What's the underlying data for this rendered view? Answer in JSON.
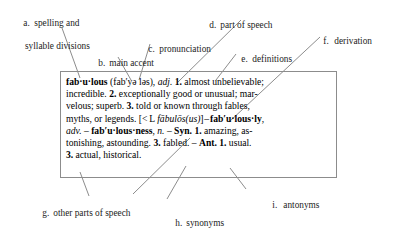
{
  "figure": {
    "kind": "annotated-dictionary-entry",
    "callouts": [
      {
        "id": "a",
        "letter": "a.",
        "label": "spelling and",
        "label2": "syllable divisions",
        "target": "fab·u·lous headword"
      },
      {
        "id": "b",
        "letter": "b.",
        "label": "main accent",
        "label2": "",
        "target": "accent mark in (fab′yə ləs)"
      },
      {
        "id": "c",
        "letter": "c.",
        "label": "pronunciation",
        "label2": "",
        "target": "(fab′yə ləs)"
      },
      {
        "id": "d",
        "letter": "d.",
        "label": "part of speech",
        "label2": "",
        "target": "adj."
      },
      {
        "id": "e",
        "letter": "e.",
        "label": "definitions",
        "label2": "",
        "target": "1. almost unbelievable; incredible."
      },
      {
        "id": "f",
        "letter": "f.",
        "label": "derivation",
        "label2": "",
        "target": "[< L fābulōs(us)]"
      },
      {
        "id": "g",
        "letter": "g.",
        "label": "other parts of speech",
        "label2": "",
        "target": "fab′u·lous·ly, adv."
      },
      {
        "id": "h",
        "letter": "h.",
        "label": "synonyms",
        "label2": "",
        "target": "Syn. 1. amazing, astonishing, astounding. 3. fabled."
      },
      {
        "id": "i",
        "letter": "i.",
        "label": "antonyms",
        "label2": "",
        "target": "Ant. 1. usual. 3. actual, historical."
      }
    ],
    "entry": {
      "headword": "fab·u·lous",
      "pronunciation": "(fab′yə ləs)",
      "part_of_speech": "adj.",
      "etymology": "[< L fābulōs(us)]",
      "definitions": [
        {
          "number": "1.",
          "text": "almost unbelievable; incredible."
        },
        {
          "number": "2.",
          "text": "exceptionally good or unusual; marvelous; superb."
        },
        {
          "number": "3.",
          "text": "told or known through fables, myths, or legends."
        }
      ],
      "derived_forms": [
        {
          "form": "fab′u·lous·ly",
          "pos": "adv."
        },
        {
          "form": "fab′u·lous·ness",
          "pos": "n."
        }
      ],
      "synonyms_label": "Syn.",
      "synonyms": "1. amazing, astonishing, astounding. 3. fabled.",
      "antonyms_label": "Ant.",
      "antonyms": "1. usual. 3. actual, historical.",
      "lines": [
        "line1",
        "line2",
        "line3",
        "line4",
        "line5",
        "line6",
        "line7"
      ]
    }
  },
  "colors": {
    "box_border": "#8c8c8c",
    "leader_line": "#6e6e6e",
    "text": "#1a1a1a",
    "background": "#ffffff"
  }
}
